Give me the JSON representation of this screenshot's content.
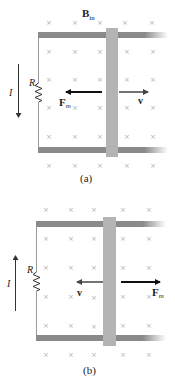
{
  "panels": [
    {
      "id": "a",
      "caption": "(a)",
      "field_label": "B",
      "field_subscript": "in",
      "resistor_label": "R",
      "current_label": "I",
      "current_direction": "down",
      "force_label": "F",
      "force_subscript": "m",
      "force_direction": "left",
      "velocity_label": "v",
      "velocity_direction": "right"
    },
    {
      "id": "b",
      "caption": "(b)",
      "resistor_label": "R",
      "current_label": "I",
      "current_direction": "up",
      "force_label": "F",
      "force_subscript": "m",
      "force_direction": "right",
      "velocity_label": "v",
      "velocity_direction": "left"
    }
  ],
  "field_symbol": "×",
  "colors": {
    "rail": "#8a8a8a",
    "bar": "#b4b4b4",
    "wire": "#9a9a9a",
    "force_arrow": "#111111",
    "velocity_arrow": "#444444",
    "field_mark": "#b0b0b0"
  }
}
